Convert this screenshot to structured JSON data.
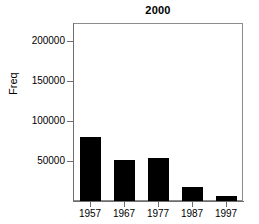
{
  "chart_data": {
    "type": "bar",
    "title": "2000",
    "xlabel": "",
    "ylabel": "Freq",
    "categories": [
      "1957",
      "1967",
      "1977",
      "1987",
      "1997"
    ],
    "values": [
      80000,
      51000,
      54000,
      17500,
      6000
    ],
    "ylim": [
      0,
      222000
    ],
    "yticks": [
      50000,
      100000,
      150000,
      200000
    ],
    "ytick_labels": [
      "50000",
      "100000",
      "150000",
      "200000"
    ],
    "grid": false,
    "legend": false,
    "bar_color": "#000000",
    "axis_color": "#6e6e6e",
    "frame_color": "#8c8c8c",
    "background": "#ffffff"
  },
  "figure": {
    "title": "2000",
    "y_axis_title": "Freq"
  }
}
